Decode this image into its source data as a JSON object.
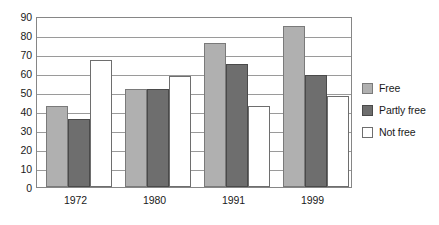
{
  "chart_data": {
    "type": "bar",
    "title": "",
    "xlabel": "",
    "ylabel": "",
    "categories": [
      "1972",
      "1980",
      "1991",
      "1999"
    ],
    "series": [
      {
        "name": "Free",
        "color": "#b0b0b0",
        "values": [
          42.5,
          51.5,
          76,
          84.5
        ]
      },
      {
        "name": "Partly free",
        "color": "#6e6e6e",
        "values": [
          36,
          51.5,
          65,
          59
        ]
      },
      {
        "name": "Not free",
        "color": "#ffffff",
        "values": [
          67,
          58.5,
          42.5,
          48
        ]
      }
    ],
    "ylim": [
      0,
      90
    ],
    "ytick_step": 10,
    "yticks": [
      "90",
      "80",
      "70",
      "60",
      "50",
      "40",
      "30",
      "20",
      "10",
      "0"
    ],
    "grid": true,
    "legend_position": "right"
  },
  "legend": {
    "items": [
      {
        "label": "Free",
        "swatch": "free"
      },
      {
        "label": "Partly free",
        "swatch": "partly"
      },
      {
        "label": "Not free",
        "swatch": "notfree"
      }
    ]
  }
}
